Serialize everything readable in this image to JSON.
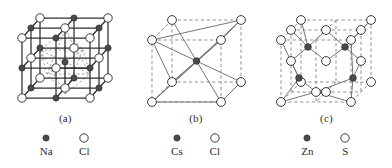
{
  "figure": {
    "background_color": "#ffffff"
  },
  "style": {
    "solid_line_color": "#2f2f2f",
    "dashed_line_color": "#8a8a8a",
    "cation_fill": "#4a4a4a",
    "anion_fill": "#ffffff",
    "atom_stroke": "#3a3a3a",
    "caption_color": "#2b2b2b"
  },
  "panels": [
    {
      "id": "nacl",
      "caption": "(a)",
      "structure_name": "rock-salt",
      "legend": [
        {
          "symbol": "Na",
          "marker": "filled-circle",
          "role": "cation"
        },
        {
          "symbol": "Cl",
          "marker": "open-circle",
          "role": "anion"
        }
      ]
    },
    {
      "id": "cscl",
      "caption": "(b)",
      "structure_name": "caesium-chloride",
      "legend": [
        {
          "symbol": "Cs",
          "marker": "filled-circle",
          "role": "cation"
        },
        {
          "symbol": "Cl",
          "marker": "open-circle",
          "role": "anion"
        }
      ]
    },
    {
      "id": "zns",
      "caption": "(c)",
      "structure_name": "zinc-blende",
      "legend": [
        {
          "symbol": "Zn",
          "marker": "filled-circle",
          "role": "cation"
        },
        {
          "symbol": "S",
          "marker": "open-circle",
          "role": "anion"
        }
      ]
    }
  ]
}
